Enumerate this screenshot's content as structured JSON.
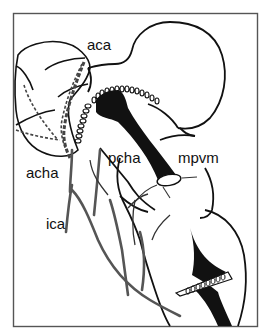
{
  "diagram": {
    "type": "anatomical line drawing (brain vasculature, lateral view)",
    "colors": {
      "background": "#ffffff",
      "outline": "#111111",
      "vessel_gray": "#555555",
      "frame": "#555555",
      "fill_black": "#111111"
    },
    "labels": {
      "aca": "aca",
      "acha": "acha",
      "ica": "ica",
      "pcha": "pcha",
      "mpvm": "mpvm"
    }
  }
}
